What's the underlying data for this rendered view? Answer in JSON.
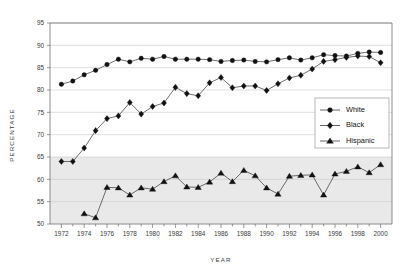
{
  "chart_data": {
    "type": "line",
    "title": "",
    "xlabel": "YEAR",
    "ylabel": "PERCENTAGE",
    "xlim": [
      1971,
      2001
    ],
    "ylim": [
      50,
      95
    ],
    "ytick_step": 5,
    "xtick_step": 2,
    "grid": true,
    "legend_position": "center-right",
    "shaded_band": [
      50,
      65
    ],
    "ytick_labels": [
      "50",
      "55",
      "60",
      "65",
      "70",
      "75",
      "80",
      "85",
      "90",
      "95"
    ],
    "xtick_labels": [
      "1972",
      "1974",
      "1976",
      "1978",
      "1980",
      "1982",
      "1984",
      "1986",
      "1988",
      "1990",
      "1992",
      "1994",
      "1996",
      "1998",
      "2000"
    ],
    "x": [
      1972,
      1973,
      1974,
      1975,
      1976,
      1977,
      1978,
      1979,
      1980,
      1981,
      1982,
      1983,
      1984,
      1985,
      1986,
      1987,
      1988,
      1989,
      1990,
      1991,
      1992,
      1993,
      1994,
      1995,
      1996,
      1997,
      1998,
      1999,
      2000
    ],
    "series": [
      {
        "name": "White",
        "marker": "circle",
        "values": [
          81.3,
          82.0,
          83.4,
          84.4,
          85.7,
          86.9,
          86.3,
          87.1,
          86.9,
          87.5,
          86.9,
          86.9,
          86.9,
          86.8,
          86.4,
          86.6,
          86.7,
          86.4,
          86.3,
          86.8,
          87.2,
          86.7,
          87.2,
          87.9,
          87.7,
          87.6,
          88.2,
          88.5,
          88.4
        ]
      },
      {
        "name": "Black",
        "marker": "diamond",
        "values": [
          64.0,
          64.0,
          67.0,
          70.9,
          73.6,
          74.2,
          77.2,
          74.6,
          76.3,
          77.1,
          80.6,
          79.2,
          78.7,
          81.6,
          82.8,
          80.5,
          80.9,
          80.9,
          79.9,
          81.4,
          82.7,
          83.3,
          84.7,
          86.4,
          86.8,
          87.3,
          87.6,
          87.5,
          86.1
        ]
      },
      {
        "name": "Hispanic",
        "marker": "triangle",
        "values": [
          null,
          null,
          52.3,
          51.4,
          58.2,
          58.1,
          56.5,
          58.1,
          57.8,
          59.5,
          60.8,
          58.3,
          58.2,
          59.4,
          61.4,
          59.5,
          62.0,
          60.8,
          58.1,
          56.7,
          60.7,
          60.9,
          61.0,
          56.5,
          61.2,
          61.8,
          62.8,
          61.5,
          63.3
        ]
      }
    ]
  },
  "legend": {
    "items": [
      {
        "label": "White"
      },
      {
        "label": "Black"
      },
      {
        "label": "Hispanic"
      }
    ]
  },
  "axes": {
    "x_title": "YEAR",
    "y_title": "PERCENTAGE"
  }
}
